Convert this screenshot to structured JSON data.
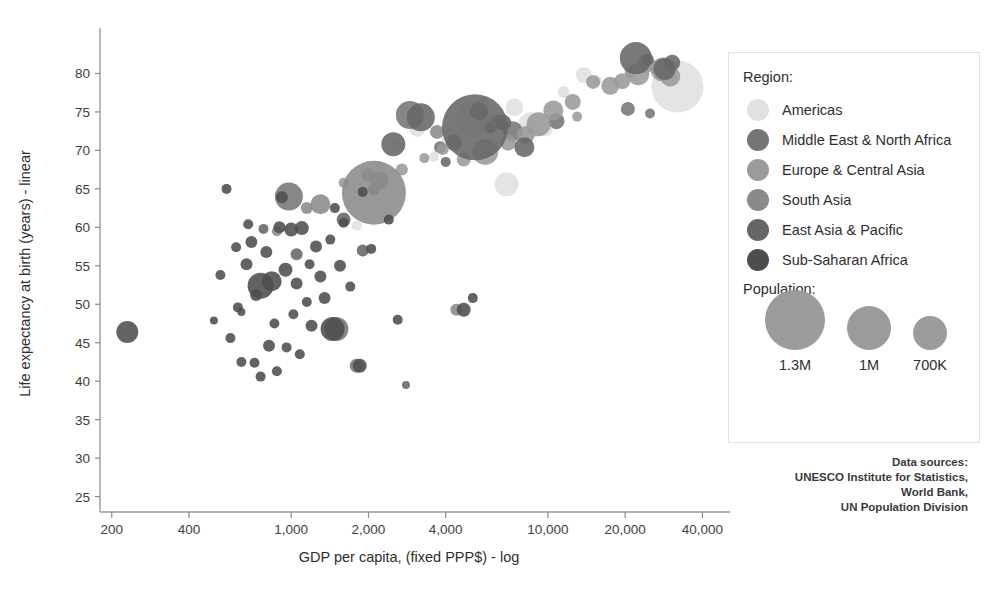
{
  "chart_data": {
    "type": "scatter",
    "title": "",
    "xlabel": "GDP per capita, (fixed PPP$) - log",
    "ylabel": "Life expectancy at birth (years) - linear",
    "xscale": "log",
    "yscale": "linear",
    "xlim": [
      180,
      46000
    ],
    "ylim": [
      23,
      85
    ],
    "grid": false,
    "xticks": [
      200,
      400,
      1000,
      2000,
      4000,
      10000,
      20000,
      40000
    ],
    "xtick_labels": [
      "200",
      "400",
      "1,000",
      "2,000",
      "4,000",
      "10,000",
      "20,000",
      "40,000"
    ],
    "yticks": [
      25,
      30,
      35,
      40,
      45,
      50,
      55,
      60,
      65,
      70,
      75,
      80
    ],
    "ytick_labels": [
      "25",
      "30",
      "35",
      "40",
      "45",
      "50",
      "55",
      "60",
      "65",
      "70",
      "75",
      "80"
    ],
    "size_encoding": "population",
    "color_encoding": "region",
    "series": [
      {
        "name": "Americas",
        "color": "#e0e0e0",
        "points": [
          {
            "x": 32000,
            "y": 78.3,
            "r": 26
          },
          {
            "x": 13800,
            "y": 79.8,
            "r": 8
          },
          {
            "x": 9800,
            "y": 72.7,
            "r": 7
          },
          {
            "x": 8600,
            "y": 73.3,
            "r": 13
          },
          {
            "x": 6900,
            "y": 65.6,
            "r": 12
          },
          {
            "x": 7400,
            "y": 75.6,
            "r": 9
          },
          {
            "x": 5100,
            "y": 74.1,
            "r": 18
          },
          {
            "x": 4200,
            "y": 71.6,
            "r": 10
          },
          {
            "x": 3100,
            "y": 72.8,
            "r": 8
          },
          {
            "x": 2600,
            "y": 70.5,
            "r": 7
          },
          {
            "x": 5600,
            "y": 76.2,
            "r": 6
          },
          {
            "x": 11500,
            "y": 77.6,
            "r": 6
          },
          {
            "x": 6100,
            "y": 70.8,
            "r": 6
          },
          {
            "x": 1800,
            "y": 60.2,
            "r": 5
          },
          {
            "x": 3600,
            "y": 69.2,
            "r": 5
          },
          {
            "x": 15500,
            "y": 79.1,
            "r": 5
          },
          {
            "x": 2200,
            "y": 68.0,
            "r": 4
          }
        ]
      },
      {
        "name": "Middle East & North Africa",
        "color": "#757575",
        "points": [
          {
            "x": 5400,
            "y": 75.1,
            "r": 9
          },
          {
            "x": 2900,
            "y": 74.6,
            "r": 14
          },
          {
            "x": 7300,
            "y": 72.5,
            "r": 10
          },
          {
            "x": 10800,
            "y": 73.8,
            "r": 8
          },
          {
            "x": 20500,
            "y": 75.4,
            "r": 7
          },
          {
            "x": 4300,
            "y": 71.0,
            "r": 8
          },
          {
            "x": 1500,
            "y": 46.8,
            "r": 12
          },
          {
            "x": 3800,
            "y": 70.4,
            "r": 6
          },
          {
            "x": 2100,
            "y": 65.0,
            "r": 6
          },
          {
            "x": 980,
            "y": 64.0,
            "r": 14
          },
          {
            "x": 25000,
            "y": 74.8,
            "r": 5
          },
          {
            "x": 1800,
            "y": 42.0,
            "r": 7
          },
          {
            "x": 6000,
            "y": 73.0,
            "r": 6
          }
        ]
      },
      {
        "name": "Europe & Central Asia",
        "color": "#9a9a9a",
        "points": [
          {
            "x": 30000,
            "y": 79.6,
            "r": 10
          },
          {
            "x": 28000,
            "y": 80.5,
            "r": 12
          },
          {
            "x": 24000,
            "y": 81.2,
            "r": 9
          },
          {
            "x": 22500,
            "y": 79.9,
            "r": 11
          },
          {
            "x": 19500,
            "y": 79.0,
            "r": 8
          },
          {
            "x": 17500,
            "y": 78.4,
            "r": 9
          },
          {
            "x": 15000,
            "y": 78.9,
            "r": 7
          },
          {
            "x": 12500,
            "y": 76.3,
            "r": 8
          },
          {
            "x": 10500,
            "y": 75.2,
            "r": 10
          },
          {
            "x": 9200,
            "y": 73.4,
            "r": 12
          },
          {
            "x": 8200,
            "y": 72.0,
            "r": 9
          },
          {
            "x": 7000,
            "y": 71.0,
            "r": 8
          },
          {
            "x": 5700,
            "y": 69.8,
            "r": 13
          },
          {
            "x": 4700,
            "y": 68.8,
            "r": 7
          },
          {
            "x": 3900,
            "y": 70.2,
            "r": 6
          },
          {
            "x": 2700,
            "y": 67.5,
            "r": 6
          },
          {
            "x": 2000,
            "y": 66.8,
            "r": 7
          },
          {
            "x": 1600,
            "y": 65.8,
            "r": 5
          },
          {
            "x": 26500,
            "y": 80.8,
            "r": 7
          },
          {
            "x": 21000,
            "y": 80.2,
            "r": 6
          },
          {
            "x": 6300,
            "y": 73.9,
            "r": 6
          },
          {
            "x": 13000,
            "y": 74.4,
            "r": 5
          },
          {
            "x": 3300,
            "y": 69.0,
            "r": 5
          }
        ]
      },
      {
        "name": "South Asia",
        "color": "#8a8a8a",
        "points": [
          {
            "x": 2100,
            "y": 64.5,
            "r": 32
          },
          {
            "x": 2200,
            "y": 66.1,
            "r": 9
          },
          {
            "x": 1300,
            "y": 63.0,
            "r": 10
          },
          {
            "x": 3700,
            "y": 72.4,
            "r": 7
          },
          {
            "x": 1150,
            "y": 62.5,
            "r": 6
          },
          {
            "x": 4400,
            "y": 49.3,
            "r": 6
          },
          {
            "x": 880,
            "y": 59.5,
            "r": 5
          }
        ]
      },
      {
        "name": "East Asia & Pacific",
        "color": "#666666",
        "points": [
          {
            "x": 5200,
            "y": 73.0,
            "r": 33
          },
          {
            "x": 3200,
            "y": 74.3,
            "r": 14
          },
          {
            "x": 22000,
            "y": 82.0,
            "r": 16
          },
          {
            "x": 28500,
            "y": 80.6,
            "r": 11
          },
          {
            "x": 30500,
            "y": 81.4,
            "r": 8
          },
          {
            "x": 8100,
            "y": 70.4,
            "r": 10
          },
          {
            "x": 2500,
            "y": 70.8,
            "r": 12
          },
          {
            "x": 1600,
            "y": 61.0,
            "r": 7
          },
          {
            "x": 1900,
            "y": 57.0,
            "r": 6
          },
          {
            "x": 6700,
            "y": 73.6,
            "r": 8
          },
          {
            "x": 2800,
            "y": 39.5,
            "r": 4
          },
          {
            "x": 1050,
            "y": 56.5,
            "r": 6
          },
          {
            "x": 24500,
            "y": 81.8,
            "r": 6
          },
          {
            "x": 4000,
            "y": 68.5,
            "r": 5
          },
          {
            "x": 780,
            "y": 59.8,
            "r": 5
          }
        ]
      },
      {
        "name": "Sub-Saharan Africa",
        "color": "#4d4d4d",
        "points": [
          {
            "x": 230,
            "y": 46.4,
            "r": 11
          },
          {
            "x": 1450,
            "y": 46.8,
            "r": 12
          },
          {
            "x": 760,
            "y": 52.4,
            "r": 13
          },
          {
            "x": 840,
            "y": 53.0,
            "r": 10
          },
          {
            "x": 560,
            "y": 65.0,
            "r": 5
          },
          {
            "x": 620,
            "y": 49.6,
            "r": 5
          },
          {
            "x": 700,
            "y": 58.1,
            "r": 6
          },
          {
            "x": 800,
            "y": 56.8,
            "r": 6
          },
          {
            "x": 900,
            "y": 60.0,
            "r": 6
          },
          {
            "x": 1000,
            "y": 59.7,
            "r": 7
          },
          {
            "x": 1100,
            "y": 59.9,
            "r": 7
          },
          {
            "x": 1250,
            "y": 57.5,
            "r": 6
          },
          {
            "x": 670,
            "y": 55.2,
            "r": 6
          },
          {
            "x": 730,
            "y": 51.2,
            "r": 6
          },
          {
            "x": 950,
            "y": 54.5,
            "r": 7
          },
          {
            "x": 1050,
            "y": 52.7,
            "r": 6
          },
          {
            "x": 1180,
            "y": 55.2,
            "r": 5
          },
          {
            "x": 580,
            "y": 45.6,
            "r": 5
          },
          {
            "x": 640,
            "y": 42.5,
            "r": 5
          },
          {
            "x": 720,
            "y": 42.4,
            "r": 5
          },
          {
            "x": 820,
            "y": 44.6,
            "r": 6
          },
          {
            "x": 880,
            "y": 41.3,
            "r": 5
          },
          {
            "x": 960,
            "y": 44.4,
            "r": 5
          },
          {
            "x": 1080,
            "y": 43.5,
            "r": 5
          },
          {
            "x": 1200,
            "y": 47.2,
            "r": 6
          },
          {
            "x": 1350,
            "y": 50.8,
            "r": 6
          },
          {
            "x": 1550,
            "y": 55.0,
            "r": 6
          },
          {
            "x": 1700,
            "y": 52.3,
            "r": 5
          },
          {
            "x": 1850,
            "y": 42.0,
            "r": 7
          },
          {
            "x": 530,
            "y": 53.8,
            "r": 5
          },
          {
            "x": 610,
            "y": 57.4,
            "r": 5
          },
          {
            "x": 680,
            "y": 60.4,
            "r": 5
          },
          {
            "x": 1020,
            "y": 48.7,
            "r": 5
          },
          {
            "x": 1150,
            "y": 50.3,
            "r": 5
          },
          {
            "x": 1300,
            "y": 53.6,
            "r": 6
          },
          {
            "x": 1420,
            "y": 58.4,
            "r": 5
          },
          {
            "x": 500,
            "y": 47.9,
            "r": 4
          },
          {
            "x": 860,
            "y": 47.5,
            "r": 5
          },
          {
            "x": 1600,
            "y": 60.6,
            "r": 5
          },
          {
            "x": 4700,
            "y": 49.3,
            "r": 7
          },
          {
            "x": 5100,
            "y": 50.8,
            "r": 5
          },
          {
            "x": 2600,
            "y": 48.0,
            "r": 5
          },
          {
            "x": 920,
            "y": 63.9,
            "r": 6
          },
          {
            "x": 1480,
            "y": 62.5,
            "r": 5
          },
          {
            "x": 2050,
            "y": 57.2,
            "r": 5
          },
          {
            "x": 760,
            "y": 40.6,
            "r": 5
          },
          {
            "x": 640,
            "y": 49.0,
            "r": 4
          },
          {
            "x": 1900,
            "y": 64.6,
            "r": 5
          },
          {
            "x": 2400,
            "y": 61.0,
            "r": 5
          }
        ]
      }
    ]
  },
  "legend": {
    "region_title": "Region:",
    "regions": [
      {
        "label": "Americas",
        "color": "#e0e0e0"
      },
      {
        "label": "Middle East & North Africa",
        "color": "#757575"
      },
      {
        "label": "Europe & Central Asia",
        "color": "#9a9a9a"
      },
      {
        "label": "South Asia",
        "color": "#8a8a8a"
      },
      {
        "label": "East Asia & Pacific",
        "color": "#666666"
      },
      {
        "label": "Sub-Saharan Africa",
        "color": "#4d4d4d"
      }
    ],
    "population_title": "Population:",
    "population_items": [
      {
        "label": "1.3M",
        "radius": 30
      },
      {
        "label": "1M",
        "radius": 22
      },
      {
        "label": "700K",
        "radius": 17
      }
    ]
  },
  "data_sources": {
    "heading": "Data sources:",
    "lines": [
      "UNESCO Institute for Statistics,",
      "World Bank,",
      "UN Population Division"
    ]
  }
}
